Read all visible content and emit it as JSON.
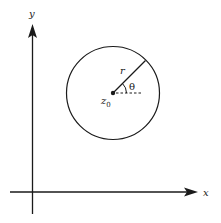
{
  "diagram": {
    "title": "",
    "axes": {
      "x_label": "x",
      "y_label": "y"
    },
    "circle": {
      "center_label": "z",
      "center_subscript": "0",
      "radius_label": "r",
      "angle_label": "θ"
    },
    "colors": {
      "stroke": "#1a1a1a",
      "background": "#ffffff"
    }
  }
}
